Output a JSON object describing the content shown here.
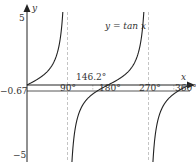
{
  "chart_data": {
    "type": "line",
    "title": "",
    "function_label": "y = tan x",
    "xlabel": "x",
    "ylabel": "y",
    "xlim": [
      0,
      360
    ],
    "ylim": [
      -5,
      5
    ],
    "x_ticks": [
      "90°",
      "180°",
      "270°",
      "360°"
    ],
    "x_tick_values": [
      90,
      180,
      270,
      360
    ],
    "y_ticks": [
      "5",
      "-5"
    ],
    "y_tick_values": [
      5,
      -5
    ],
    "horizontal_line": {
      "y": -0.67,
      "label": "-0.67"
    },
    "annotation": {
      "label": "146.2°",
      "x": 146.2
    },
    "asymptotes": [
      90,
      270
    ],
    "series": [
      {
        "name": "y = tan x",
        "function": "tan",
        "domain": [
          0,
          360
        ]
      }
    ],
    "grid": false,
    "legend": "none"
  },
  "labels": {
    "y_axis": "y",
    "x_axis": "x",
    "y_top": "5",
    "y_bottom": "−5",
    "hline": "−0.67",
    "tick_90": "90°",
    "tick_180": "180°",
    "tick_270": "270°",
    "tick_360": "360°",
    "annotation": "146.2°",
    "curve_label": "y = tan x"
  },
  "colors": {
    "axis": "#222222",
    "curve": "#222222",
    "asymptote": "#b0b0b0",
    "hline": "#444444",
    "text": "#333333"
  }
}
